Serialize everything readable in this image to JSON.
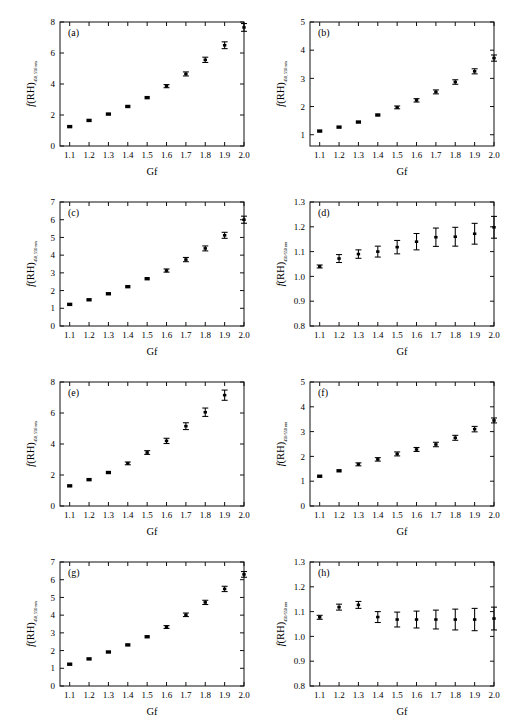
{
  "figure": {
    "background": "#ffffff",
    "axis_color": "#111111",
    "marker_color": "#000000",
    "width": 518,
    "height": 728,
    "shared_xlabel": "Gf",
    "x_tick_labels": [
      "1.1",
      "1.2",
      "1.3",
      "1.4",
      "1.5",
      "1.6",
      "1.7",
      "1.8",
      "1.9",
      "2.0"
    ]
  },
  "chart_data": [
    {
      "type": "scatter",
      "panel": "(a)",
      "title": "",
      "xlabel": "Gf",
      "ylabel": "f(RH)",
      "ylabel_subscript": "450, 550 nm",
      "xlim": [
        1.05,
        2.0
      ],
      "ylim": [
        0,
        8
      ],
      "xticks": [
        1.1,
        1.2,
        1.3,
        1.4,
        1.5,
        1.6,
        1.7,
        1.8,
        1.9,
        2.0
      ],
      "yticks": [
        0,
        2,
        4,
        6,
        8
      ],
      "ytick_labels": [
        "0",
        "2",
        "4",
        "6",
        "8"
      ],
      "grid": false,
      "legend": "none",
      "x": [
        1.1,
        1.2,
        1.3,
        1.4,
        1.5,
        1.6,
        1.7,
        1.8,
        1.9,
        2.0
      ],
      "values": [
        1.25,
        1.65,
        2.06,
        2.55,
        3.12,
        3.86,
        4.65,
        5.56,
        6.5,
        7.65
      ],
      "yerr": [
        0.05,
        0.05,
        0.06,
        0.06,
        0.07,
        0.1,
        0.13,
        0.17,
        0.22,
        0.25
      ]
    },
    {
      "type": "scatter",
      "panel": "(b)",
      "title": "",
      "xlabel": "Gf",
      "ylabel": "f(RH)",
      "ylabel_subscript": "450, 550 nm",
      "xlim": [
        1.05,
        2.0
      ],
      "ylim": [
        0.6,
        5
      ],
      "xticks": [
        1.1,
        1.2,
        1.3,
        1.4,
        1.5,
        1.6,
        1.7,
        1.8,
        1.9,
        2.0
      ],
      "yticks": [
        1,
        2,
        3,
        4,
        5
      ],
      "ytick_labels": [
        "1",
        "2",
        "3",
        "4",
        "5"
      ],
      "grid": false,
      "legend": "none",
      "x": [
        1.1,
        1.2,
        1.3,
        1.4,
        1.5,
        1.6,
        1.7,
        1.8,
        1.9,
        2.0
      ],
      "values": [
        1.13,
        1.27,
        1.45,
        1.7,
        1.97,
        2.22,
        2.52,
        2.87,
        3.25,
        3.72
      ],
      "yerr": [
        0.03,
        0.03,
        0.04,
        0.04,
        0.05,
        0.06,
        0.07,
        0.08,
        0.09,
        0.11
      ]
    },
    {
      "type": "scatter",
      "panel": "(c)",
      "title": "",
      "xlabel": "Gf",
      "ylabel": "f(RH)",
      "ylabel_subscript": "450, 550 nm",
      "xlim": [
        1.05,
        2.0
      ],
      "ylim": [
        0,
        7
      ],
      "xticks": [
        1.1,
        1.2,
        1.3,
        1.4,
        1.5,
        1.6,
        1.7,
        1.8,
        1.9,
        2.0
      ],
      "yticks": [
        0,
        1,
        2,
        3,
        4,
        5,
        6,
        7
      ],
      "ytick_labels": [
        "0",
        "1",
        "2",
        "3",
        "4",
        "5",
        "6",
        "7"
      ],
      "grid": false,
      "legend": "none",
      "x": [
        1.1,
        1.2,
        1.3,
        1.4,
        1.5,
        1.6,
        1.7,
        1.8,
        1.9,
        2.0
      ],
      "values": [
        1.22,
        1.48,
        1.82,
        2.22,
        2.67,
        3.13,
        3.75,
        4.38,
        5.12,
        6.0
      ],
      "yerr": [
        0.04,
        0.04,
        0.05,
        0.06,
        0.07,
        0.09,
        0.12,
        0.14,
        0.17,
        0.2
      ]
    },
    {
      "type": "scatter",
      "panel": "(d)",
      "title": "",
      "xlabel": "Gf",
      "ylabel": "f(RH)",
      "ylabel_subscript": "450/550 nm",
      "xlim": [
        1.05,
        2.0
      ],
      "ylim": [
        0.8,
        1.3
      ],
      "xticks": [
        1.1,
        1.2,
        1.3,
        1.4,
        1.5,
        1.6,
        1.7,
        1.8,
        1.9,
        2.0
      ],
      "yticks": [
        0.8,
        0.9,
        1.0,
        1.1,
        1.2,
        1.3
      ],
      "ytick_labels": [
        "0.8",
        "0.9",
        "1.0",
        "1.1",
        "1.2",
        "1.3"
      ],
      "grid": false,
      "legend": "none",
      "x": [
        1.1,
        1.2,
        1.3,
        1.4,
        1.5,
        1.6,
        1.7,
        1.8,
        1.9,
        2.0
      ],
      "values": [
        1.04,
        1.072,
        1.09,
        1.1,
        1.118,
        1.14,
        1.158,
        1.16,
        1.172,
        1.198
      ],
      "yerr": [
        0.006,
        0.016,
        0.017,
        0.022,
        0.027,
        0.033,
        0.037,
        0.038,
        0.042,
        0.044
      ]
    },
    {
      "type": "scatter",
      "panel": "(e)",
      "title": "",
      "xlabel": "Gf",
      "ylabel": "f(RH)",
      "ylabel_subscript": "450, 550 nm",
      "xlim": [
        1.05,
        2.0
      ],
      "ylim": [
        0,
        8
      ],
      "xticks": [
        1.1,
        1.2,
        1.3,
        1.4,
        1.5,
        1.6,
        1.7,
        1.8,
        1.9,
        2.0
      ],
      "yticks": [
        0,
        2,
        4,
        6,
        8
      ],
      "ytick_labels": [
        "0",
        "2",
        "4",
        "6",
        "8"
      ],
      "grid": false,
      "legend": "none",
      "x": [
        1.1,
        1.2,
        1.3,
        1.4,
        1.5,
        1.6,
        1.7,
        1.8,
        1.9
      ],
      "values": [
        1.3,
        1.7,
        2.16,
        2.75,
        3.45,
        4.2,
        5.15,
        6.05,
        7.15
      ],
      "yerr": [
        0.05,
        0.05,
        0.07,
        0.09,
        0.12,
        0.17,
        0.22,
        0.27,
        0.33
      ]
    },
    {
      "type": "scatter",
      "panel": "(f)",
      "title": "",
      "xlabel": "Gf",
      "ylabel": "f(RH)",
      "ylabel_subscript": "450/550 nm",
      "xlim": [
        1.05,
        2.0
      ],
      "ylim": [
        0,
        5
      ],
      "xticks": [
        1.1,
        1.2,
        1.3,
        1.4,
        1.5,
        1.6,
        1.7,
        1.8,
        1.9,
        2.0
      ],
      "yticks": [
        0,
        1,
        2,
        3,
        4,
        5
      ],
      "ytick_labels": [
        "0",
        "1",
        "2",
        "3",
        "4",
        "5"
      ],
      "grid": false,
      "legend": "none",
      "x": [
        1.1,
        1.2,
        1.3,
        1.4,
        1.5,
        1.6,
        1.7,
        1.8,
        1.9,
        2.0
      ],
      "values": [
        1.2,
        1.42,
        1.68,
        1.88,
        2.1,
        2.28,
        2.48,
        2.75,
        3.1,
        3.45
      ],
      "yerr": [
        0.04,
        0.05,
        0.06,
        0.07,
        0.08,
        0.08,
        0.09,
        0.1,
        0.11,
        0.1
      ]
    },
    {
      "type": "scatter",
      "panel": "(g)",
      "title": "",
      "xlabel": "Gf",
      "ylabel": "f(RH)",
      "ylabel_subscript": "450, 550 nm",
      "xlim": [
        1.05,
        2.0
      ],
      "ylim": [
        0,
        7
      ],
      "xticks": [
        1.1,
        1.2,
        1.3,
        1.4,
        1.5,
        1.6,
        1.7,
        1.8,
        1.9,
        2.0
      ],
      "yticks": [
        0,
        1,
        2,
        3,
        4,
        5,
        6,
        7
      ],
      "ytick_labels": [
        "0",
        "1",
        "2",
        "3",
        "4",
        "5",
        "6",
        "7"
      ],
      "grid": false,
      "legend": "none",
      "x": [
        1.1,
        1.2,
        1.3,
        1.4,
        1.5,
        1.6,
        1.7,
        1.8,
        1.9,
        2.0
      ],
      "values": [
        1.23,
        1.53,
        1.92,
        2.32,
        2.78,
        3.33,
        4.02,
        4.72,
        5.48,
        6.3
      ],
      "yerr": [
        0.04,
        0.04,
        0.05,
        0.06,
        0.07,
        0.08,
        0.1,
        0.12,
        0.15,
        0.16
      ]
    },
    {
      "type": "scatter",
      "panel": "(h)",
      "title": "",
      "xlabel": "Gf",
      "ylabel": "f(RH)",
      "ylabel_subscript": "450/550 nm",
      "xlim": [
        1.05,
        2.0
      ],
      "ylim": [
        0.8,
        1.3
      ],
      "xticks": [
        1.1,
        1.2,
        1.3,
        1.4,
        1.5,
        1.6,
        1.7,
        1.8,
        1.9,
        2.0
      ],
      "yticks": [
        0.8,
        0.9,
        1.0,
        1.1,
        1.2,
        1.3
      ],
      "ytick_labels": [
        "0.8",
        "0.9",
        "1.0",
        "1.1",
        "1.2",
        "1.3"
      ],
      "grid": false,
      "legend": "none",
      "x": [
        1.1,
        1.2,
        1.3,
        1.4,
        1.5,
        1.6,
        1.7,
        1.8,
        1.9,
        2.0
      ],
      "values": [
        1.077,
        1.118,
        1.127,
        1.078,
        1.068,
        1.068,
        1.068,
        1.068,
        1.068,
        1.072
      ],
      "yerr": [
        0.008,
        0.012,
        0.014,
        0.022,
        0.03,
        0.034,
        0.038,
        0.042,
        0.045,
        0.046
      ]
    }
  ]
}
